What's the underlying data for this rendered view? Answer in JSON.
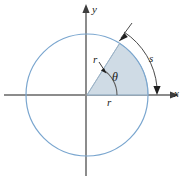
{
  "figure": {
    "axes": {
      "x_label": "x",
      "y_label": "y",
      "axis_color": "#808080",
      "origin": {
        "x": 86,
        "y": 95
      }
    },
    "circle": {
      "center_x": 87,
      "center_y": 95,
      "radius": 61,
      "stroke_color": "#6f9fd0",
      "fill": "none"
    },
    "sector": {
      "label_theta": "θ",
      "start_angle_deg": 0,
      "end_angle_deg": 58,
      "fill_color": "#ccd9e4",
      "edge_color": "#8aa6bd"
    },
    "labels": {
      "radius_upper": "r",
      "radius_lower": "r",
      "arc_length": "s",
      "angle": "θ"
    },
    "arc_marker": {
      "name": "arc-length-indicator",
      "color": "#4a4a4a",
      "description": "curved double-headed arrow spanning the sector arc, labelled s"
    }
  }
}
